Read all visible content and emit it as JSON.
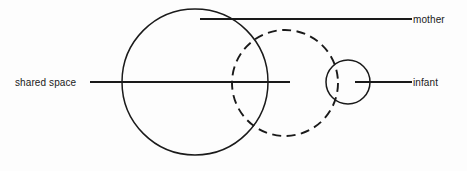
{
  "diagram": {
    "background_color": "#fdfdfd",
    "stroke_color": "#1a1a1a",
    "labels": {
      "shared_space": "shared space",
      "mother": "mother",
      "infant": "infant"
    },
    "shapes": [
      {
        "name": "mother-circle",
        "style": "solid",
        "cx": 195,
        "cy": 82,
        "r": 73
      },
      {
        "name": "shared-space-circle",
        "style": "dashed",
        "cx": 285,
        "cy": 83,
        "r": 53
      },
      {
        "name": "infant-circle",
        "style": "solid",
        "cx": 348,
        "cy": 82,
        "r": 22
      }
    ],
    "leader_lines": [
      {
        "name": "mother-leader-line",
        "x1": 200,
        "y1": 19,
        "x2": 412,
        "y2": 19
      },
      {
        "name": "shared-space-leader-line",
        "x1": 90,
        "y1": 82,
        "x2": 290,
        "y2": 82
      },
      {
        "name": "infant-leader-line",
        "x1": 355,
        "y1": 82,
        "x2": 412,
        "y2": 82
      }
    ]
  }
}
